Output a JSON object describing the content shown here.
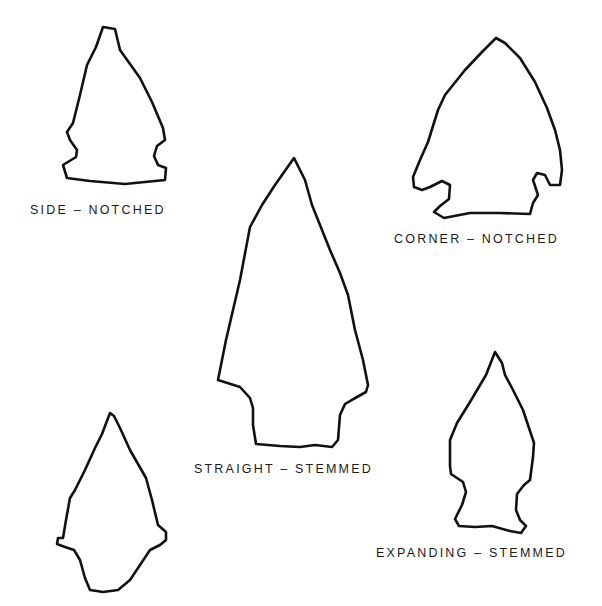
{
  "diagram": {
    "type": "projectile point shape types",
    "points": [
      {
        "id": "side-notched",
        "label": "SIDE – NOTCHED"
      },
      {
        "id": "corner-notched",
        "label": "CORNER – NOTCHED"
      },
      {
        "id": "straight-stemmed",
        "label": "STRAIGHT – STEMMED"
      },
      {
        "id": "expanding-stemmed",
        "label": "EXPANDING – STEMMED"
      },
      {
        "id": "contracting-stemmed",
        "label": ""
      }
    ],
    "colors": {
      "line": "#111111",
      "background": "#ffffff"
    }
  }
}
